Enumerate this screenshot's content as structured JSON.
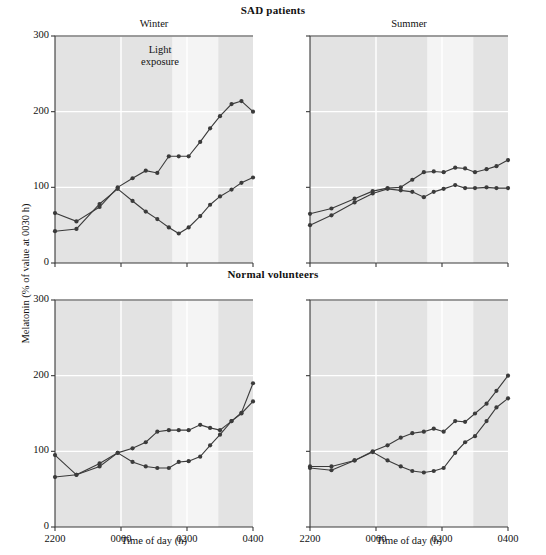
{
  "figure": {
    "width": 546,
    "height": 555,
    "background": "#ffffff",
    "plot_background": "#e3e3e3",
    "light_band_color": "#f4f4f4",
    "gridline_color": "#ffffff",
    "axis_color": "#3a3a3a",
    "series_color": "#3b3b3b"
  },
  "titles": {
    "sad_patients": "SAD patients",
    "normal_volunteers": "Normal volunteers"
  },
  "panel_titles": {
    "winter": "Winter",
    "summer": "Summer"
  },
  "axes": {
    "ylabel": "Melatonin (% of value at 0030 h)",
    "xlabel": "Time of day (h)",
    "yticks": [
      "0",
      "100",
      "200",
      "300"
    ],
    "ytick_values": [
      0,
      100,
      200,
      300
    ],
    "ylim": [
      0,
      300
    ],
    "xticks": [
      "2200",
      "0000",
      "0200",
      "0400"
    ],
    "xtick_values": [
      22.0,
      24.0,
      26.0,
      28.0
    ],
    "xlim": [
      22.0,
      28.0
    ],
    "grid": "horizontal and vertical white gridlines at ticks"
  },
  "annotations": {
    "light_exposure_line1": "Light",
    "light_exposure_line2": "exposure",
    "light_exposure_start": 25.55,
    "light_exposure_end": 26.95
  },
  "chart_data": {
    "type": "line",
    "xlabel": "Time of day (h)",
    "ylabel": "Melatonin (% of value at 0030 h)",
    "xlim": [
      22.0,
      28.0
    ],
    "ylim": [
      0,
      300
    ],
    "xticks": [
      22.0,
      24.0,
      26.0,
      28.0
    ],
    "xtick_labels": [
      "2200",
      "0000",
      "0200",
      "0400"
    ],
    "yticks": [
      0,
      100,
      200,
      300
    ],
    "grid": true,
    "legend": "none",
    "shaded_region": {
      "label": "Light exposure",
      "x_start": 25.55,
      "x_end": 26.95
    },
    "panels": [
      {
        "row": 0,
        "col": 0,
        "group": "SAD patients",
        "season": "Winter",
        "series": [
          {
            "name": "SAD Winter series A (light-suppressed)",
            "x": [
              22.0,
              22.65,
              23.35,
              23.9,
              24.35,
              24.75,
              25.1,
              25.45,
              25.75,
              26.05,
              26.4,
              26.7,
              27.0,
              27.35,
              27.65,
              28.0
            ],
            "y": [
              42,
              45,
              78,
              98,
              82,
              68,
              58,
              47,
              39,
              47,
              62,
              77,
              88,
              97,
              106,
              113
            ]
          },
          {
            "name": "SAD Winter series B (rising)",
            "x": [
              22.0,
              22.65,
              23.35,
              23.9,
              24.35,
              24.75,
              25.1,
              25.45,
              25.75,
              26.05,
              26.4,
              26.7,
              27.0,
              27.35,
              27.65,
              28.0
            ],
            "y": [
              66,
              55,
              74,
              100,
              112,
              122,
              119,
              141,
              141,
              141,
              160,
              178,
              194,
              210,
              214,
              200
            ]
          }
        ]
      },
      {
        "row": 0,
        "col": 1,
        "group": "SAD patients",
        "season": "Summer",
        "series": [
          {
            "name": "SAD Summer series A (lower)",
            "x": [
              22.0,
              22.65,
              23.35,
              23.9,
              24.35,
              24.75,
              25.1,
              25.45,
              25.75,
              26.05,
              26.4,
              26.7,
              27.0,
              27.35,
              27.65,
              28.0
            ],
            "y": [
              50,
              63,
              80,
              92,
              98,
              96,
              94,
              87,
              94,
              98,
              103,
              99,
              99,
              100,
              99,
              99
            ]
          },
          {
            "name": "SAD Summer series B (upper)",
            "x": [
              22.0,
              22.65,
              23.35,
              23.9,
              24.35,
              24.75,
              25.1,
              25.45,
              25.75,
              26.05,
              26.4,
              26.7,
              27.0,
              27.35,
              27.65,
              28.0
            ],
            "y": [
              65,
              72,
              85,
              95,
              99,
              100,
              110,
              120,
              121,
              120,
              126,
              125,
              120,
              124,
              128,
              136
            ]
          }
        ]
      },
      {
        "row": 1,
        "col": 0,
        "group": "Normal volunteers",
        "season": "Winter",
        "series": [
          {
            "name": "Normal Winter series A (light-suppressed)",
            "x": [
              22.0,
              22.65,
              23.35,
              23.9,
              24.35,
              24.75,
              25.1,
              25.45,
              25.75,
              26.05,
              26.4,
              26.7,
              27.0,
              27.35,
              27.65,
              28.0
            ],
            "y": [
              66,
              69,
              80,
              98,
              86,
              80,
              78,
              78,
              86,
              87,
              93,
              108,
              122,
              140,
              150,
              166
            ]
          },
          {
            "name": "Normal Winter series B (rising)",
            "x": [
              22.0,
              22.65,
              23.35,
              23.9,
              24.35,
              24.75,
              25.1,
              25.45,
              25.75,
              26.05,
              26.4,
              26.7,
              27.0,
              27.35,
              27.65,
              28.0
            ],
            "y": [
              95,
              69,
              84,
              98,
              104,
              112,
              126,
              128,
              128,
              128,
              135,
              131,
              128,
              140,
              151,
              190
            ]
          }
        ]
      },
      {
        "row": 1,
        "col": 1,
        "group": "Normal volunteers",
        "season": "Summer",
        "series": [
          {
            "name": "Normal Summer series A (light-suppressed)",
            "x": [
              22.0,
              22.65,
              23.35,
              23.9,
              24.35,
              24.75,
              25.1,
              25.45,
              25.75,
              26.05,
              26.4,
              26.7,
              27.0,
              27.35,
              27.65,
              28.0
            ],
            "y": [
              78,
              75,
              88,
              99,
              88,
              80,
              74,
              72,
              74,
              78,
              98,
              112,
              120,
              140,
              158,
              170
            ]
          },
          {
            "name": "Normal Summer series B (rising)",
            "x": [
              22.0,
              22.65,
              23.35,
              23.9,
              24.35,
              24.75,
              25.1,
              25.45,
              25.75,
              26.05,
              26.4,
              26.7,
              27.0,
              27.35,
              27.65,
              28.0
            ],
            "y": [
              80,
              80,
              88,
              100,
              108,
              118,
              124,
              126,
              130,
              126,
              140,
              139,
              150,
              163,
              180,
              200
            ]
          }
        ]
      }
    ]
  }
}
